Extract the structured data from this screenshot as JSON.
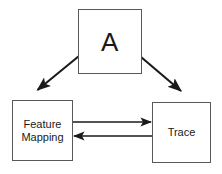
{
  "diagram": {
    "type": "flow-diagram",
    "background_color": "#ffffff",
    "stroke_color": "#1a1a1a",
    "box_border_color": "#595959",
    "text_color": "#1a1a1a",
    "nodes": [
      {
        "id": "a",
        "label": "A",
        "x": 78,
        "y": 9,
        "width": 64,
        "height": 65
      },
      {
        "id": "feature-mapping",
        "label": "Feature\nMapping",
        "x": 12,
        "y": 100,
        "width": 61,
        "height": 61
      },
      {
        "id": "trace",
        "label": "Trace",
        "x": 152,
        "y": 102,
        "width": 59,
        "height": 61
      }
    ],
    "edges": [
      {
        "id": "a-to-feature-mapping",
        "from": "a",
        "to": "feature-mapping",
        "direction": "one-way",
        "style": "diagonal-down-left"
      },
      {
        "id": "a-to-trace",
        "from": "a",
        "to": "trace",
        "direction": "one-way",
        "style": "diagonal-down-right"
      },
      {
        "id": "feature-mapping-to-trace",
        "from": "feature-mapping",
        "to": "trace",
        "direction": "one-way",
        "style": "horizontal-right"
      },
      {
        "id": "trace-to-feature-mapping",
        "from": "trace",
        "to": "feature-mapping",
        "direction": "one-way",
        "style": "horizontal-left"
      }
    ]
  }
}
